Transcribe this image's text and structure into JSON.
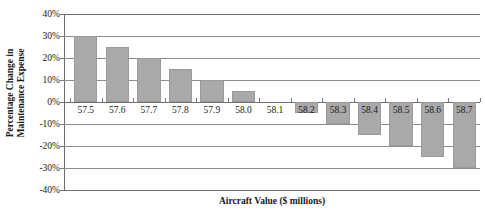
{
  "chart_data": {
    "type": "bar",
    "title": "",
    "xlabel": "Aircraft Value ($ millions)",
    "ylabel_lines": [
      "Percentage Change in",
      "Maintenance Expense"
    ],
    "ylabel": "Percentage Change in Maintenance Expense",
    "categories": [
      "57.5",
      "57.6",
      "57.7",
      "57.8",
      "57.9",
      "58.0",
      "58.1",
      "58.2",
      "58.3",
      "58.4",
      "58.5",
      "58.6",
      "58.7"
    ],
    "values": [
      30,
      25,
      20,
      15,
      10,
      5,
      0,
      -5,
      -10,
      -15,
      -20,
      -25,
      -30
    ],
    "value_labels": [
      "30%",
      "25%",
      "20%",
      "15%",
      "10%",
      "5%",
      "0%",
      "-5%",
      "-10%",
      "-15%",
      "-20%",
      "-25%",
      "-30%"
    ],
    "ylim": [
      -40,
      40
    ],
    "ytick_values": [
      40,
      30,
      20,
      10,
      0,
      -10,
      -20,
      -30,
      -40
    ],
    "ytick_labels": [
      "40%",
      "30%",
      "20%",
      "10%",
      "0%",
      "-10%",
      "-20%",
      "-30%",
      "-40%"
    ],
    "grid": true,
    "grid_axis": "y",
    "legend": false,
    "legend_position": "none",
    "bar_color": "#a9a9a9",
    "gridline_color": "#8c8c8c",
    "axis_color": "#6e6e6e",
    "text_color": "#1a1a1a",
    "background_color": "#ffffff",
    "series": [
      {
        "name": "Percentage Change in Maintenance Expense",
        "values": [
          30,
          25,
          20,
          15,
          10,
          5,
          0,
          -5,
          -10,
          -15,
          -20,
          -25,
          -30
        ]
      }
    ]
  }
}
